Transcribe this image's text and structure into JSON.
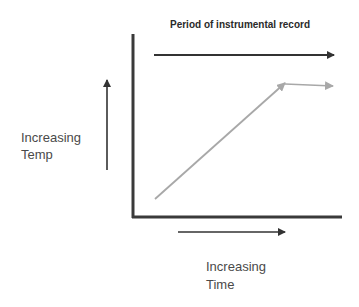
{
  "diagram": {
    "title": "Period of instrumental record",
    "y_label": {
      "line1": "Increasing",
      "line2": "Temp"
    },
    "x_label": {
      "line1": "Increasing",
      "line2": "Time"
    },
    "colors": {
      "axis": "#3a3a3a",
      "arrow_dark": "#333333",
      "trend_line": "#a8a8a8"
    },
    "elements": [
      {
        "name": "y-axis",
        "type": "line",
        "from": [
          133,
          34
        ],
        "to": [
          133,
          217
        ]
      },
      {
        "name": "x-axis",
        "type": "line",
        "from": [
          133,
          217
        ],
        "to": [
          342,
          217
        ]
      },
      {
        "name": "instrumental-period-arrow",
        "type": "arrow",
        "from": [
          154,
          55
        ],
        "to": [
          334,
          55
        ]
      },
      {
        "name": "temp-direction-arrow",
        "type": "arrow",
        "from": [
          107,
          170
        ],
        "to": [
          107,
          80
        ]
      },
      {
        "name": "time-direction-arrow",
        "type": "arrow",
        "from": [
          178,
          232
        ],
        "to": [
          285,
          232
        ]
      },
      {
        "name": "temperature-rise-line",
        "type": "arrow",
        "from": [
          155,
          199
        ],
        "to": [
          285,
          83
        ]
      },
      {
        "name": "temperature-plateau-line",
        "type": "arrow",
        "from": [
          285,
          84
        ],
        "to": [
          333,
          86
        ]
      }
    ]
  }
}
